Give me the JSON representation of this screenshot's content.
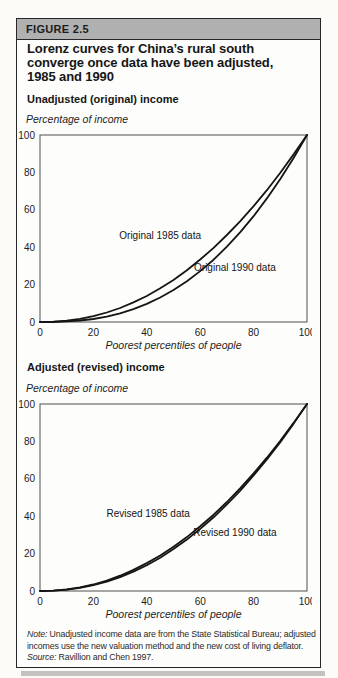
{
  "figure": {
    "tag": "FIGURE 2.5",
    "title_lines": [
      "Lorenz curves for China’s rural south",
      "converge once data have been adjusted,",
      "1985 and 1990"
    ]
  },
  "note": {
    "note_label": "Note:",
    "note_text": " Unadjusted income data are from the State Statistical Bureau; adjusted incomes use the new valuation method and the new cost of living deflator.",
    "source_label": "Source:",
    "source_text": " Ravillion and Chen 1997."
  },
  "colors": {
    "band_gray": "#b0b0b0",
    "curve_black": "#151515",
    "plot_frame_gray": "#4f4f4f",
    "box_border_black": "#262626"
  },
  "chart_data": [
    {
      "type": "line",
      "section_label": "Unadjusted (original) income",
      "ylabel": "Percentage of income",
      "xlabel": "Poorest percentiles of people",
      "xlim": [
        0,
        100
      ],
      "ylim": [
        0,
        100
      ],
      "x_ticks": [
        0,
        20,
        40,
        60,
        80,
        100
      ],
      "y_ticks": [
        0,
        20,
        40,
        60,
        80,
        100
      ],
      "grid": false,
      "x": [
        0,
        5,
        10,
        15,
        20,
        25,
        30,
        35,
        40,
        45,
        50,
        55,
        60,
        65,
        70,
        75,
        80,
        85,
        90,
        95,
        100
      ],
      "series": [
        {
          "name": "Original 1985 data",
          "values": [
            0,
            0.2,
            0.7,
            1.7,
            3.1,
            5.1,
            7.5,
            10.5,
            13.9,
            18.0,
            22.5,
            27.7,
            33.4,
            39.6,
            46.5,
            53.9,
            61.9,
            70.5,
            79.8,
            89.6,
            100
          ],
          "label_anchor": {
            "x": 45,
            "y": 44.5
          }
        },
        {
          "name": "Original 1990 data",
          "values": [
            0,
            0,
            0.3,
            0.8,
            1.6,
            2.9,
            4.6,
            6.9,
            9.7,
            13.1,
            17.1,
            21.8,
            27.2,
            33.3,
            40.3,
            48.0,
            56.6,
            66.1,
            76.4,
            87.7,
            100
          ],
          "label_anchor": {
            "x": 73,
            "y": 27.5
          }
        }
      ]
    },
    {
      "type": "line",
      "section_label": "Adjusted (revised) income",
      "ylabel": "Percentage of income",
      "xlabel": "Poorest percentiles of people",
      "xlim": [
        0,
        100
      ],
      "ylim": [
        0,
        100
      ],
      "x_ticks": [
        0,
        20,
        40,
        60,
        80,
        100
      ],
      "y_ticks": [
        0,
        20,
        40,
        60,
        80,
        100
      ],
      "grid": false,
      "x": [
        0,
        5,
        10,
        15,
        20,
        25,
        30,
        35,
        40,
        45,
        50,
        55,
        60,
        65,
        70,
        75,
        80,
        85,
        90,
        95,
        100
      ],
      "series": [
        {
          "name": "Revised 1985 data",
          "values": [
            0,
            0.2,
            0.8,
            1.9,
            3.5,
            5.6,
            8.2,
            11.3,
            14.9,
            19.0,
            23.7,
            28.8,
            34.6,
            40.8,
            47.6,
            55.0,
            62.9,
            71.3,
            80.3,
            89.9,
            100
          ],
          "label_anchor": {
            "x": 40.5,
            "y": 39.5
          }
        },
        {
          "name": "Revised 1990 data",
          "values": [
            0,
            0.2,
            0.7,
            1.7,
            3.1,
            5.0,
            7.4,
            10.4,
            13.8,
            17.8,
            22.4,
            27.5,
            33.2,
            39.4,
            46.3,
            53.7,
            61.8,
            70.4,
            79.6,
            89.5,
            100
          ],
          "label_anchor": {
            "x": 73,
            "y": 29.5
          }
        }
      ]
    }
  ]
}
